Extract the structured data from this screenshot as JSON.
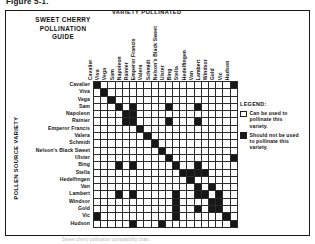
{
  "figure": {
    "caption": "Figure 5-1."
  },
  "guide": {
    "title_lines": [
      "SWEET CHERRY",
      "POLLINATION",
      "GUIDE"
    ]
  },
  "axes": {
    "top_title": "VARIETY POLLINATED",
    "left_title": "POLLEN SOURCE VARIETY"
  },
  "legend": {
    "title": "LEGEND:",
    "items": [
      {
        "swatch": "open",
        "text": "Can be used to pollinate this variety."
      },
      {
        "swatch": "filled",
        "text": "Should not be used to pollinate this variety."
      }
    ]
  },
  "source_note": "Sweet cherry pollination compatibility chart.",
  "chart_data": {
    "type": "heatmap",
    "title": "Sweet Cherry Pollination Guide",
    "xlabel": "VARIETY POLLINATED",
    "ylabel": "POLLEN SOURCE VARIETY",
    "grid": true,
    "legend_position": "right",
    "value_meaning": {
      "0": "Can be used to pollinate this variety (open cell)",
      "1": "Should not be used to pollinate this variety (filled cell)"
    },
    "categories": [
      "Cavalier",
      "Viva",
      "Vega",
      "Sam",
      "Napoleon",
      "Rainier",
      "Emperor Francis",
      "Valera",
      "Schmidt",
      "Nelson's Black Sweet",
      "Ulster",
      "Bing",
      "Stella",
      "Hedelfingen",
      "Van",
      "Lambert",
      "Windsor",
      "Gold",
      "Vic",
      "Hudson"
    ],
    "rows": [
      "Cavalier",
      "Viva",
      "Vega",
      "Sam",
      "Napoleon",
      "Rainier",
      "Emperor Francis",
      "Valera",
      "Schmidt",
      "Nelson's Black Sweet",
      "Ulster",
      "Bing",
      "Stella",
      "Hedelfingen",
      "Van",
      "Lambert",
      "Windsor",
      "Gold",
      "Vic",
      "Hudson"
    ],
    "matrix": [
      [
        1,
        0,
        0,
        0,
        0,
        0,
        0,
        0,
        0,
        0,
        0,
        0,
        0,
        0,
        0,
        0,
        0,
        0,
        0,
        1
      ],
      [
        0,
        1,
        0,
        0,
        0,
        0,
        0,
        0,
        0,
        0,
        0,
        0,
        0,
        0,
        0,
        0,
        0,
        0,
        0,
        0
      ],
      [
        0,
        0,
        1,
        0,
        0,
        0,
        0,
        0,
        0,
        0,
        0,
        0,
        0,
        0,
        0,
        0,
        0,
        0,
        0,
        0
      ],
      [
        0,
        0,
        0,
        1,
        0,
        1,
        0,
        0,
        0,
        0,
        1,
        0,
        0,
        0,
        1,
        0,
        0,
        0,
        0,
        0
      ],
      [
        0,
        0,
        0,
        0,
        1,
        1,
        0,
        0,
        0,
        0,
        0,
        0,
        0,
        0,
        0,
        0,
        0,
        0,
        0,
        0
      ],
      [
        0,
        0,
        0,
        0,
        1,
        1,
        0,
        0,
        0,
        0,
        1,
        0,
        0,
        0,
        1,
        0,
        0,
        0,
        0,
        0
      ],
      [
        0,
        0,
        0,
        0,
        0,
        0,
        1,
        0,
        0,
        0,
        0,
        0,
        0,
        0,
        0,
        0,
        0,
        0,
        0,
        0
      ],
      [
        0,
        0,
        0,
        0,
        0,
        0,
        0,
        1,
        0,
        0,
        0,
        0,
        0,
        0,
        0,
        0,
        0,
        0,
        0,
        0
      ],
      [
        0,
        0,
        0,
        0,
        0,
        0,
        0,
        0,
        1,
        0,
        0,
        0,
        0,
        0,
        0,
        0,
        0,
        0,
        0,
        0
      ],
      [
        0,
        0,
        0,
        0,
        0,
        0,
        0,
        0,
        0,
        1,
        0,
        0,
        0,
        0,
        0,
        0,
        0,
        0,
        0,
        0
      ],
      [
        0,
        0,
        0,
        0,
        0,
        0,
        0,
        0,
        0,
        0,
        1,
        0,
        0,
        0,
        0,
        0,
        0,
        0,
        0,
        1
      ],
      [
        0,
        0,
        0,
        1,
        0,
        1,
        0,
        0,
        0,
        0,
        0,
        1,
        0,
        0,
        1,
        0,
        0,
        0,
        0,
        0
      ],
      [
        0,
        0,
        0,
        0,
        0,
        0,
        0,
        0,
        0,
        0,
        0,
        0,
        1,
        1,
        1,
        1,
        0,
        0,
        0,
        0
      ],
      [
        0,
        0,
        0,
        0,
        0,
        0,
        0,
        0,
        0,
        0,
        0,
        0,
        0,
        1,
        0,
        0,
        0,
        0,
        0,
        0
      ],
      [
        0,
        0,
        0,
        0,
        0,
        0,
        0,
        0,
        0,
        0,
        0,
        0,
        0,
        0,
        1,
        0,
        1,
        0,
        0,
        0
      ],
      [
        0,
        0,
        0,
        1,
        0,
        1,
        0,
        0,
        0,
        0,
        0,
        1,
        0,
        0,
        1,
        1,
        0,
        1,
        0,
        0
      ],
      [
        0,
        0,
        0,
        0,
        0,
        0,
        0,
        0,
        0,
        0,
        0,
        1,
        0,
        0,
        0,
        0,
        1,
        1,
        0,
        0
      ],
      [
        0,
        0,
        0,
        0,
        0,
        0,
        0,
        0,
        0,
        0,
        0,
        1,
        0,
        0,
        1,
        0,
        1,
        1,
        0,
        0
      ],
      [
        1,
        0,
        0,
        0,
        0,
        0,
        0,
        0,
        0,
        0,
        0,
        1,
        0,
        0,
        0,
        0,
        0,
        0,
        1,
        0
      ],
      [
        0,
        0,
        0,
        0,
        0,
        1,
        0,
        0,
        0,
        1,
        0,
        0,
        0,
        0,
        0,
        0,
        0,
        0,
        0,
        1
      ]
    ]
  }
}
